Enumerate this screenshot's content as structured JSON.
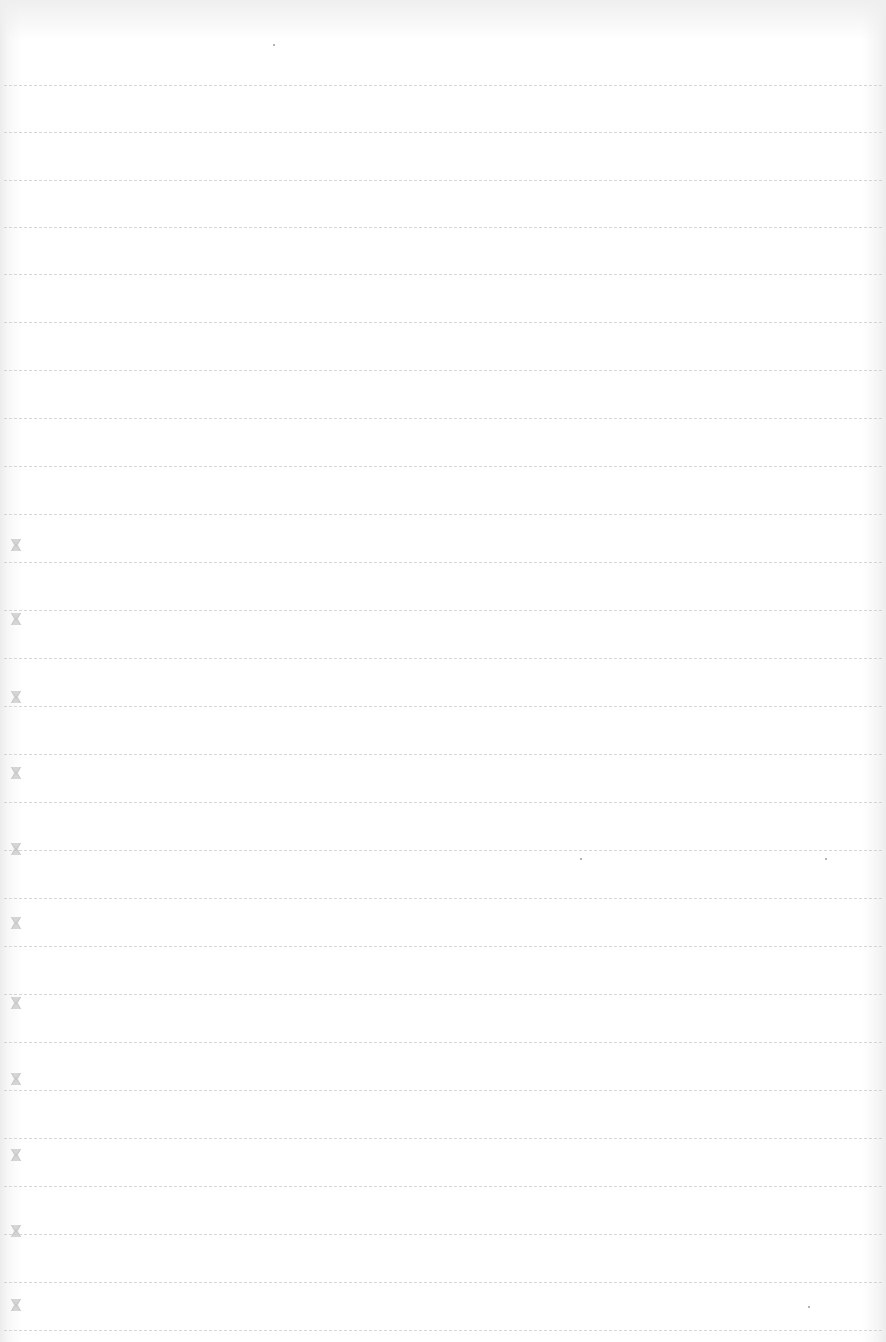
{
  "page": {
    "type": "blank lined notebook page",
    "background_color": "#ffffff",
    "rule_color": "#cfcfcf",
    "mark_color": "#c8c8c8"
  },
  "rules": [
    {
      "y": 85
    },
    {
      "y": 132
    },
    {
      "y": 180
    },
    {
      "y": 227
    },
    {
      "y": 274
    },
    {
      "y": 322
    },
    {
      "y": 370
    },
    {
      "y": 418
    },
    {
      "y": 466
    },
    {
      "y": 514
    },
    {
      "y": 562
    },
    {
      "y": 610
    },
    {
      "y": 658
    },
    {
      "y": 706
    },
    {
      "y": 754
    },
    {
      "y": 802
    },
    {
      "y": 850
    },
    {
      "y": 898
    },
    {
      "y": 946
    },
    {
      "y": 994
    },
    {
      "y": 1042
    },
    {
      "y": 1090
    },
    {
      "y": 1138
    },
    {
      "y": 1186
    },
    {
      "y": 1234
    },
    {
      "y": 1282
    },
    {
      "y": 1330
    }
  ],
  "margin_marks": [
    {
      "icon": "bowtie-mark-icon",
      "y": 538
    },
    {
      "icon": "bowtie-mark-icon",
      "y": 612
    },
    {
      "icon": "bowtie-mark-icon",
      "y": 690
    },
    {
      "icon": "bowtie-mark-icon",
      "y": 766
    },
    {
      "icon": "bowtie-mark-icon",
      "y": 842
    },
    {
      "icon": "bowtie-mark-icon",
      "y": 916
    },
    {
      "icon": "bowtie-mark-icon",
      "y": 996
    },
    {
      "icon": "bowtie-mark-icon",
      "y": 1072
    },
    {
      "icon": "bowtie-mark-icon",
      "y": 1148
    },
    {
      "icon": "bowtie-mark-icon",
      "y": 1224
    },
    {
      "icon": "bowtie-mark-icon",
      "y": 1298
    }
  ],
  "specks": [
    {
      "x": 273,
      "y": 44
    },
    {
      "x": 580,
      "y": 858
    },
    {
      "x": 825,
      "y": 858
    },
    {
      "x": 808,
      "y": 1306
    }
  ]
}
